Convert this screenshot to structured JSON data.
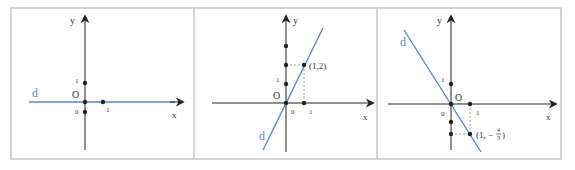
{
  "colors": {
    "line": "#5b86cc",
    "axis": "#222222",
    "frame": "#b8b8b8",
    "dash": "#888888",
    "label_d": "#5b86cc"
  },
  "panels": [
    {
      "id": "panel-1",
      "line_label": "d",
      "origin_label": "O",
      "x_axis_label": "x",
      "y_axis_label": "y",
      "tick_labels": {
        "x_one": "1",
        "y_one": "1",
        "zero": "0"
      },
      "equation_note": "horizontal line y = 0"
    },
    {
      "id": "panel-2",
      "line_label": "d",
      "origin_label": "O",
      "x_axis_label": "x",
      "y_axis_label": "y",
      "tick_labels": {
        "x_one": "1",
        "y_one": "1",
        "zero": "0"
      },
      "point_label": "(1,2)"
    },
    {
      "id": "panel-3",
      "line_label": "d",
      "origin_label": "O",
      "x_axis_label": "x",
      "y_axis_label": "y",
      "tick_labels": {
        "x_one": "1",
        "y_one": "1",
        "zero": "0"
      },
      "point_label_prefix": "(1, −",
      "point_label_num": "4",
      "point_label_den": "3",
      "point_label_suffix": ")"
    }
  ]
}
